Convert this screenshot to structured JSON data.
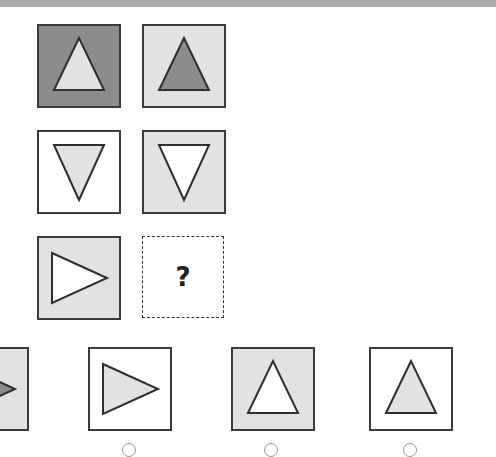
{
  "puzzle": {
    "colors": {
      "dark": "#8c8c8c",
      "light": "#e2e2e2",
      "white": "#ffffff",
      "stroke": "#2e2e2e"
    },
    "grid": [
      [
        {
          "bg": "dark",
          "shape": "triangle-up",
          "fill": "light"
        },
        {
          "bg": "light",
          "shape": "triangle-up",
          "fill": "dark"
        }
      ],
      [
        {
          "bg": "white",
          "shape": "triangle-down",
          "fill": "light"
        },
        {
          "bg": "light",
          "shape": "triangle-down",
          "fill": "white"
        }
      ],
      [
        {
          "bg": "light",
          "shape": "triangle-right",
          "fill": "white"
        },
        {
          "missing": true,
          "label": "?"
        }
      ]
    ],
    "options": [
      {
        "bg": "light",
        "shape": "triangle-right",
        "fill": "dark",
        "partially_visible": true
      },
      {
        "bg": "white",
        "shape": "triangle-right",
        "fill": "light"
      },
      {
        "bg": "light",
        "shape": "triangle-up",
        "fill": "white"
      },
      {
        "bg": "white",
        "shape": "triangle-up",
        "fill": "light"
      }
    ],
    "missing_label": "?"
  }
}
